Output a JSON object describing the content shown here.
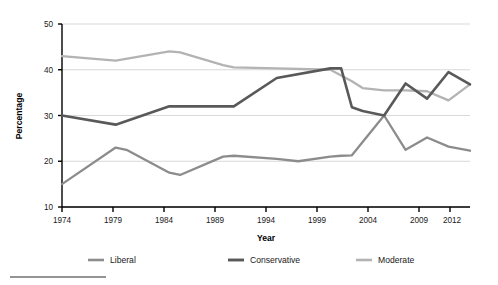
{
  "chart_data": {
    "type": "line",
    "title": "",
    "xlabel": "Year",
    "ylabel": "Percentage",
    "xlim": [
      1974,
      2012
    ],
    "ylim": [
      10,
      50
    ],
    "yticks": [
      10,
      20,
      30,
      40,
      50
    ],
    "xticks": [
      1974,
      1979,
      1984,
      1989,
      1994,
      1999,
      2004,
      2009,
      2012
    ],
    "grid": true,
    "legend_position": "bottom",
    "series": [
      {
        "name": "Liberal",
        "color": "#8c8c8c",
        "x": [
          1974,
          1979,
          1980,
          1984,
          1985,
          1989,
          1990,
          1994,
          1996,
          1999,
          2000,
          2001,
          2004,
          2006,
          2008,
          2010,
          2012
        ],
        "values": [
          15.0,
          23.0,
          22.5,
          17.5,
          17.0,
          21.0,
          21.2,
          20.5,
          20.0,
          21.0,
          21.2,
          21.3,
          30.0,
          22.5,
          25.2,
          23.2,
          22.3
        ]
      },
      {
        "name": "Conservative",
        "color": "#595959",
        "x": [
          1974,
          1979,
          1984,
          1985,
          1989,
          1990,
          1994,
          1999,
          2000,
          2001,
          2002,
          2004,
          2006,
          2008,
          2010,
          2012
        ],
        "values": [
          30.0,
          28.0,
          32.0,
          32.0,
          32.0,
          32.0,
          38.2,
          40.3,
          40.3,
          31.8,
          31.0,
          30.0,
          37.0,
          33.7,
          39.5,
          36.8
        ]
      },
      {
        "name": "Moderate",
        "color": "#b3b3b3",
        "x": [
          1974,
          1979,
          1984,
          1985,
          1989,
          1990,
          1994,
          1999,
          2001,
          2002,
          2004,
          2006,
          2008,
          2010,
          2012
        ],
        "values": [
          43.0,
          42.0,
          44.0,
          43.8,
          41.0,
          40.5,
          40.3,
          40.0,
          37.5,
          36.0,
          35.5,
          35.5,
          35.3,
          33.3,
          36.8
        ]
      }
    ]
  },
  "axes": {
    "y_title": "Percentage",
    "x_title": "Year",
    "y_tick_labels": [
      "50",
      "40",
      "30",
      "20",
      "10"
    ],
    "x_tick_labels": [
      "1974",
      "1979",
      "1984",
      "1989",
      "1994",
      "1999",
      "2004",
      "2009",
      "2012"
    ]
  },
  "legend": {
    "items": [
      {
        "label": "Liberal",
        "color": "#8c8c8c"
      },
      {
        "label": "Conservative",
        "color": "#595959"
      },
      {
        "label": "Moderate",
        "color": "#b3b3b3"
      }
    ]
  },
  "footnote": {
    "rule_present": true
  }
}
